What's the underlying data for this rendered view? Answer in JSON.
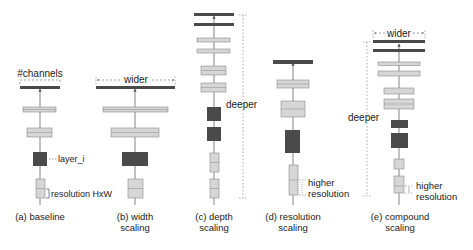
{
  "colors": {
    "dark_block": "#4a4a4a",
    "light_block": "#d6d6d6",
    "light_stroke": "#8a8a8a",
    "arrow": "#555555",
    "text": "#1a1a1a",
    "dotted": "#888888"
  },
  "panels": [
    {
      "id": "baseline",
      "caption_line1": "(a) baseline",
      "caption_line2": "",
      "annotations": {
        "channels": "#channels",
        "layer": "layer_i",
        "resolution": "resolution HxW"
      }
    },
    {
      "id": "width",
      "caption_line1": "(b) width",
      "caption_line2": "scaling",
      "annotations": {
        "wider": "wider"
      }
    },
    {
      "id": "depth",
      "caption_line1": "(c) depth",
      "caption_line2": "scaling",
      "annotations": {
        "deeper": "deeper"
      }
    },
    {
      "id": "resolution",
      "caption_line1": "(d) resolution",
      "caption_line2": "scaling",
      "annotations": {
        "higher": "higher",
        "resolution": "resolution"
      }
    },
    {
      "id": "compound",
      "caption_line1": "(e) compound",
      "caption_line2": "scaling",
      "annotations": {
        "wider": "wider",
        "deeper": "deeper",
        "higher": "higher",
        "resolution": "resolution"
      }
    }
  ]
}
